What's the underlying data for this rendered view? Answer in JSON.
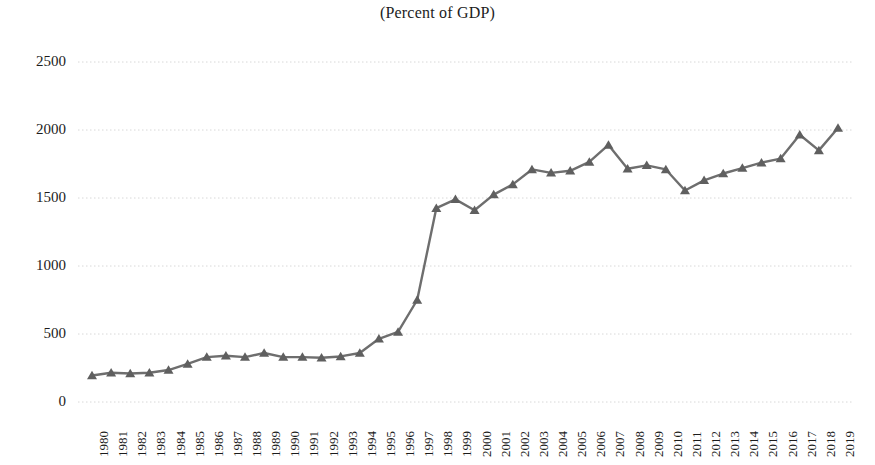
{
  "chart_data": {
    "type": "line",
    "title": "(Percent of GDP)",
    "subtitle": "",
    "xlabel": "",
    "ylabel": "",
    "ylim": [
      0,
      2500
    ],
    "yticks": [
      0,
      500,
      1000,
      1500,
      2000,
      2500
    ],
    "grid": true,
    "legend_position": "none",
    "marker": "triangle",
    "line_color": "#6e6e6e",
    "marker_color": "#5f5f5f",
    "gridline_color": "#d8d8d8",
    "categories": [
      "1980",
      "1981",
      "1982",
      "1983",
      "1984",
      "1985",
      "1986",
      "1987",
      "1988",
      "1989",
      "1990",
      "1991",
      "1992",
      "1993",
      "1994",
      "1995",
      "1996",
      "1997",
      "1998",
      "1999",
      "2000",
      "2001",
      "2002",
      "2003",
      "2004",
      "2005",
      "2006",
      "2007",
      "2008",
      "2009",
      "2010",
      "2011",
      "2012",
      "2013",
      "2014",
      "2015",
      "2016",
      "2017",
      "2018",
      "2019"
    ],
    "series": [
      {
        "name": "Percent of GDP",
        "values": [
          195,
          215,
          210,
          215,
          235,
          280,
          330,
          340,
          330,
          360,
          330,
          330,
          325,
          335,
          360,
          465,
          515,
          750,
          1425,
          1490,
          1410,
          1525,
          1600,
          1710,
          1685,
          1700,
          1765,
          1890,
          1715,
          1740,
          1710,
          1555,
          1630,
          1680,
          1720,
          1760,
          1790,
          1965,
          1850,
          2015
        ]
      }
    ]
  },
  "axes": {
    "y_tick_labels": [
      "2500",
      "2000",
      "1500",
      "1000",
      "500",
      "0"
    ],
    "x_tick_labels": [
      "1980",
      "1981",
      "1982",
      "1983",
      "1984",
      "1985",
      "1986",
      "1987",
      "1988",
      "1989",
      "1990",
      "1991",
      "1992",
      "1993",
      "1994",
      "1995",
      "1996",
      "1997",
      "1998",
      "1999",
      "2000",
      "2001",
      "2002",
      "2003",
      "2004",
      "2005",
      "2006",
      "2007",
      "2008",
      "2009",
      "2010",
      "2011",
      "2012",
      "2013",
      "2014",
      "2015",
      "2016",
      "2017",
      "2018",
      "2019"
    ]
  }
}
